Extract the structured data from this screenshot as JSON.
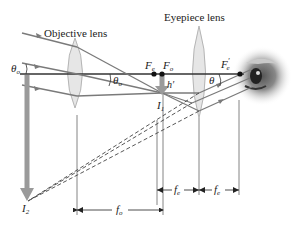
{
  "diagram": {
    "labels": {
      "objective_lens": "Objective lens",
      "eyepiece_lens": "Eyepiece lens",
      "theta_o_left": "θ",
      "theta_o_left_sub": "o",
      "theta_o_right": "θ",
      "theta_o_right_sub": "o",
      "theta": "θ",
      "F_e": "F",
      "F_e_sub": "e",
      "F_o": "F",
      "F_o_sub": "o",
      "F_e_prime": "F",
      "F_e_prime_sub": "e",
      "F_e_prime_mark": "′",
      "h_prime": "h′",
      "I1": "I",
      "I1_sub": "1",
      "I2": "I",
      "I2_sub": "2",
      "f_o": "f",
      "f_o_sub": "o",
      "f_e_1": "f",
      "f_e_1_sub": "e",
      "f_e_2": "f",
      "f_e_2_sub": "e"
    },
    "colors": {
      "axis": "#333333",
      "ray": "#7a7a7a",
      "lens_fill": "#e6e6e6",
      "lens_stroke": "#b5b5b5",
      "image_arrow": "#9a9a9a",
      "dot": "#111111"
    }
  }
}
